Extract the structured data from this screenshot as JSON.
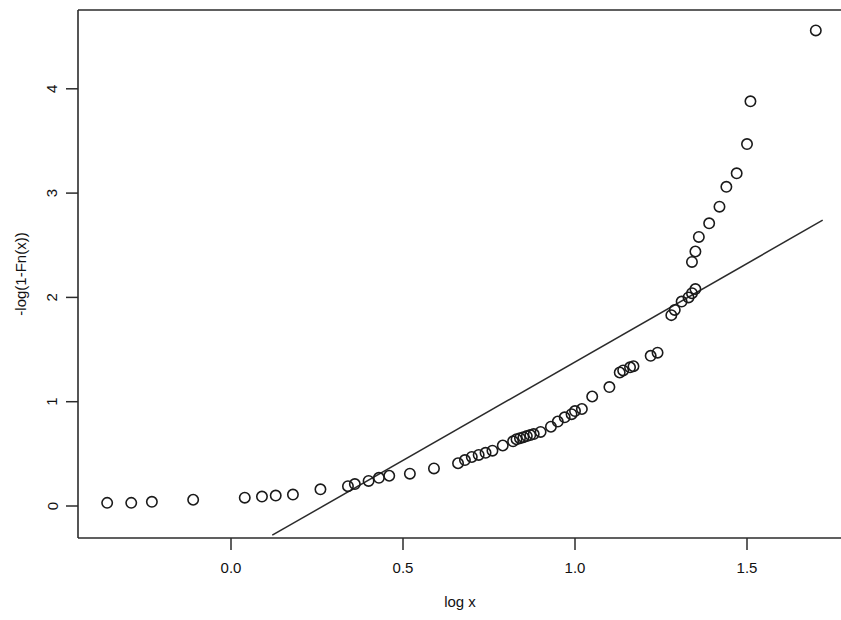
{
  "chart_data": {
    "type": "scatter",
    "title": "",
    "xlabel": "log x",
    "ylabel": "-log(1-Fn(x))",
    "xlim": [
      -0.45,
      1.77
    ],
    "ylim": [
      -0.31,
      5.06
    ],
    "xticks": [
      0.0,
      0.5,
      1.0,
      1.5
    ],
    "xticklabels": [
      "0.0",
      "0.5",
      "1.0",
      "1.5"
    ],
    "yticks": [
      0,
      1,
      2,
      3,
      4
    ],
    "yticklabels": [
      "0",
      "1",
      "2",
      "3",
      "4"
    ],
    "grid": false,
    "legend": null,
    "frame": "box-open-right",
    "marker": "open-circle",
    "series": [
      {
        "name": "empirical exceedance",
        "type": "scatter",
        "x": [
          -0.36,
          -0.29,
          -0.23,
          -0.11,
          0.04,
          0.09,
          0.13,
          0.18,
          0.26,
          0.34,
          0.36,
          0.4,
          0.43,
          0.46,
          0.52,
          0.59,
          0.66,
          0.68,
          0.7,
          0.72,
          0.74,
          0.76,
          0.79,
          0.82,
          0.83,
          0.84,
          0.85,
          0.86,
          0.87,
          0.88,
          0.9,
          0.93,
          0.95,
          0.97,
          0.99,
          1.0,
          1.02,
          1.05,
          1.1,
          1.13,
          1.14,
          1.16,
          1.17,
          1.22,
          1.24,
          1.28,
          1.29,
          1.31,
          1.33,
          1.34,
          1.35,
          1.34,
          1.35,
          1.36,
          1.39,
          1.42,
          1.44,
          1.47,
          1.5,
          1.51,
          1.7
        ],
        "y": [
          0.03,
          0.03,
          0.04,
          0.06,
          0.08,
          0.09,
          0.1,
          0.11,
          0.16,
          0.19,
          0.21,
          0.24,
          0.27,
          0.29,
          0.31,
          0.36,
          0.41,
          0.44,
          0.47,
          0.49,
          0.51,
          0.53,
          0.58,
          0.62,
          0.64,
          0.65,
          0.66,
          0.67,
          0.68,
          0.69,
          0.71,
          0.76,
          0.81,
          0.85,
          0.88,
          0.91,
          0.93,
          1.05,
          1.14,
          1.28,
          1.3,
          1.33,
          1.34,
          1.44,
          1.47,
          1.83,
          1.88,
          1.96,
          2.0,
          2.04,
          2.08,
          2.34,
          2.44,
          2.58,
          2.71,
          2.87,
          3.06,
          3.19,
          3.47,
          3.88,
          4.56
        ]
      }
    ],
    "reference_line": {
      "name": "fitted straight line",
      "x": [
        0.12,
        1.72
      ],
      "y": [
        -0.28,
        2.74
      ]
    }
  },
  "axes": {
    "x_label": "log x",
    "y_label": "-log(1-Fn(x))"
  }
}
